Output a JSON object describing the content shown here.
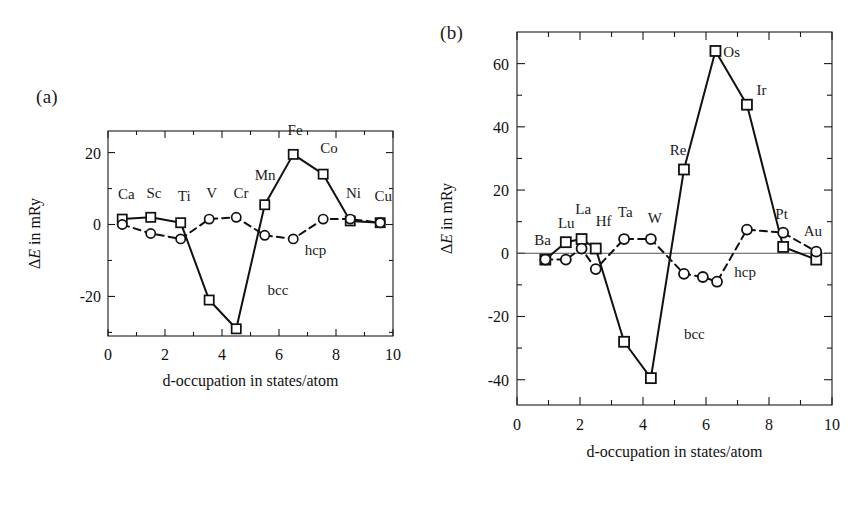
{
  "figure": {
    "panels": [
      {
        "tag": "(a)",
        "xlabel": "d-occupation in states/atom",
        "ylabel_prefix": "Δ",
        "ylabel_italic": "E",
        "ylabel_suffix": " in mRy",
        "series_labels": {
          "bcc": "bcc",
          "hcp": "hcp"
        }
      },
      {
        "tag": "(b)",
        "xlabel": "d-occupation in states/atom",
        "ylabel_prefix": "Δ",
        "ylabel_italic": "E",
        "ylabel_suffix": " in mRy",
        "series_labels": {
          "bcc": "bcc",
          "hcp": "hcp"
        }
      }
    ]
  },
  "chart_data": [
    {
      "type": "line",
      "panel": "(a)",
      "title": "",
      "xlabel": "d-occupation in states/atom",
      "ylabel": "ΔE in mRy",
      "xlim": [
        0,
        10
      ],
      "ylim": [
        -31,
        26
      ],
      "xticks": [
        0,
        2,
        4,
        6,
        8,
        10
      ],
      "xticklabels": [
        "0",
        "2",
        "4",
        "6",
        "8",
        "10"
      ],
      "yticks": [
        -20,
        0,
        20
      ],
      "yticklabels": [
        "-20",
        "0",
        "20"
      ],
      "yminorticks": [
        -30,
        -10,
        10
      ],
      "grid": false,
      "legend": "inline-annotations",
      "series": [
        {
          "name": "bcc",
          "marker": "square",
          "linestyle": "solid",
          "point_labels": [
            "Ca",
            "Sc",
            "Ti",
            "Mn",
            "Fe",
            "Co",
            "Ni",
            "Cu"
          ],
          "x": [
            0.5,
            1.5,
            2.55,
            3.55,
            4.5,
            5.5,
            6.5,
            7.55,
            8.5,
            9.55
          ],
          "y": [
            1.5,
            2.0,
            0.5,
            -21.0,
            -29.0,
            5.5,
            19.5,
            14.0,
            1.0,
            0.5
          ],
          "point_names": [
            "Ca",
            "Sc",
            "Ti",
            "V",
            "Cr",
            "Mn",
            "Fe",
            "Co",
            "Ni",
            "Cu"
          ]
        },
        {
          "name": "hcp",
          "marker": "circle",
          "linestyle": "dashed",
          "x": [
            0.5,
            1.5,
            2.55,
            3.55,
            4.5,
            5.5,
            6.5,
            7.55,
            8.5,
            9.55
          ],
          "y": [
            0.0,
            -2.5,
            -4.0,
            1.5,
            2.0,
            -3.0,
            -4.0,
            1.5,
            1.5,
            0.5
          ],
          "point_names": [
            "Ca",
            "Sc",
            "Ti",
            "V",
            "Cr",
            "Mn",
            "Fe",
            "Co",
            "Ni",
            "Cu"
          ]
        }
      ],
      "annotations": [
        {
          "text": "Ca",
          "x": 0.35,
          "y": 7.0
        },
        {
          "text": "Sc",
          "x": 1.35,
          "y": 7.5
        },
        {
          "text": "Ti",
          "x": 2.45,
          "y": 6.5
        },
        {
          "text": "V",
          "x": 3.45,
          "y": 7.5
        },
        {
          "text": "Cr",
          "x": 4.4,
          "y": 7.5
        },
        {
          "text": "Mn",
          "x": 5.15,
          "y": 12.5
        },
        {
          "text": "Fe",
          "x": 6.3,
          "y": 25.0
        },
        {
          "text": "Co",
          "x": 7.45,
          "y": 20.0
        },
        {
          "text": "Ni",
          "x": 8.35,
          "y": 7.5
        },
        {
          "text": "Cu",
          "x": 9.35,
          "y": 6.5
        },
        {
          "text": "bcc",
          "x": 5.6,
          "y": -19.5
        },
        {
          "text": "hcp",
          "x": 6.9,
          "y": -8.5
        }
      ]
    },
    {
      "type": "line",
      "panel": "(b)",
      "title": "",
      "xlabel": "d-occupation in states/atom",
      "ylabel": "ΔE in mRy",
      "xlim": [
        0,
        10
      ],
      "ylim": [
        -48,
        70
      ],
      "xticks": [
        0,
        2,
        4,
        6,
        8,
        10
      ],
      "xticklabels": [
        "0",
        "2",
        "4",
        "6",
        "8",
        "10"
      ],
      "yticks": [
        -40,
        -20,
        0,
        20,
        40,
        60
      ],
      "yticklabels": [
        "-40",
        "-20",
        "0",
        "20",
        "40",
        "60"
      ],
      "yminorticks": [
        -30,
        -10,
        10,
        30,
        50
      ],
      "grid": false,
      "legend": "inline-annotations",
      "series": [
        {
          "name": "bcc",
          "marker": "square",
          "linestyle": "solid",
          "x": [
            0.9,
            1.55,
            2.05,
            2.5,
            3.4,
            4.25,
            5.3,
            6.3,
            7.3,
            8.45,
            9.5
          ],
          "y": [
            -2.0,
            3.5,
            4.5,
            1.5,
            -28.0,
            -39.5,
            26.5,
            64.0,
            47.0,
            2.0,
            -2.0
          ],
          "point_names": [
            "Ba",
            "Lu",
            "La",
            "Hf",
            "Ta",
            "W",
            "Re",
            "Os",
            "Ir",
            "Pt",
            "Au"
          ]
        },
        {
          "name": "hcp",
          "marker": "circle",
          "linestyle": "dashed",
          "x": [
            0.9,
            1.55,
            2.05,
            2.5,
            3.4,
            4.25,
            5.3,
            5.9,
            6.35,
            7.3,
            8.45,
            9.5
          ],
          "y": [
            -2.0,
            -2.0,
            1.5,
            -5.0,
            4.5,
            4.5,
            -6.5,
            -7.5,
            -9.0,
            7.5,
            6.5,
            0.5
          ],
          "point_names": [
            "Ba",
            "Lu",
            "La",
            "Hf",
            "Ta",
            "W",
            "Re",
            "",
            "Os",
            "Ir",
            "Pt",
            "Au"
          ]
        }
      ],
      "annotations": [
        {
          "text": "Ba",
          "x": 0.55,
          "y": 2.5
        },
        {
          "text": "Lu",
          "x": 1.3,
          "y": 8.0
        },
        {
          "text": "La",
          "x": 1.85,
          "y": 12.5
        },
        {
          "text": "Hf",
          "x": 2.5,
          "y": 8.5
        },
        {
          "text": "Ta",
          "x": 3.2,
          "y": 11.5
        },
        {
          "text": "W",
          "x": 4.15,
          "y": 9.5
        },
        {
          "text": "Re",
          "x": 4.85,
          "y": 31.0
        },
        {
          "text": "Os",
          "x": 6.55,
          "y": 62.0
        },
        {
          "text": "Ir",
          "x": 7.6,
          "y": 50.0
        },
        {
          "text": "Pt",
          "x": 8.2,
          "y": 11.0
        },
        {
          "text": "Au",
          "x": 9.1,
          "y": 5.5
        },
        {
          "text": "bcc",
          "x": 5.3,
          "y": -27.0
        },
        {
          "text": "hcp",
          "x": 6.9,
          "y": -7.5
        }
      ]
    }
  ]
}
